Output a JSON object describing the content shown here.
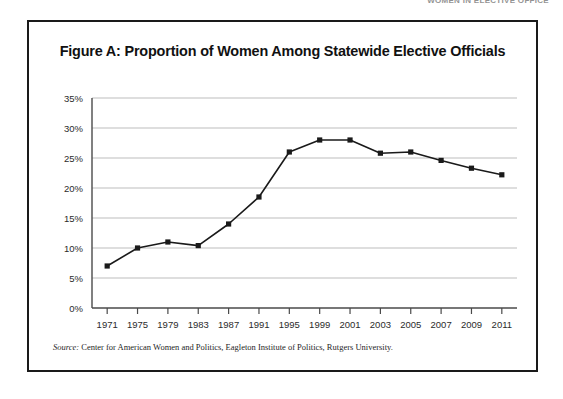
{
  "page_header": "WOMEN IN ELECTIVE OFFICE",
  "figure": {
    "title": "Figure A: Proportion of Women Among Statewide Elective Officials",
    "source_label": "Source:",
    "source_text": " Center for American Women and Politics, Eagleton Institute of Politics, Rutgers University."
  },
  "chart_data": {
    "type": "line",
    "title": "Figure A: Proportion of Women Among Statewide Elective Officials",
    "xlabel": "",
    "ylabel": "",
    "categories": [
      "1971",
      "1975",
      "1979",
      "1983",
      "1987",
      "1991",
      "1995",
      "1999",
      "2001",
      "2003",
      "2005",
      "2007",
      "2009",
      "2011"
    ],
    "values": [
      7.0,
      10.0,
      11.0,
      10.4,
      14.0,
      18.5,
      26.0,
      28.0,
      28.0,
      25.8,
      26.0,
      24.6,
      23.3,
      22.2
    ],
    "ylim": [
      0,
      35
    ],
    "ytick_labels": [
      "0%",
      "5%",
      "10%",
      "15%",
      "20%",
      "25%",
      "30%",
      "35%"
    ],
    "ytick_values": [
      0,
      5,
      10,
      15,
      20,
      25,
      30,
      35
    ],
    "grid": true,
    "legend": false,
    "series_color": "#1a1a1a",
    "marker": "square",
    "gridline_color": "#bdbdbd",
    "axis_color": "#4a4a4a"
  }
}
